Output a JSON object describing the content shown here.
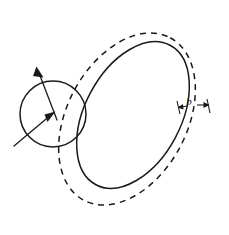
{
  "figure": {
    "title": "",
    "background_color": "#ffffff",
    "stroke_color": "#1a1a1a",
    "width": 229,
    "height": 235
  },
  "labels": {
    "gap_label": "b"
  },
  "shapes": {
    "outer_dashed_ellipse": {
      "name": "outer-dashed-ellipse",
      "style": "dashed",
      "center_x": 127,
      "center_y": 119,
      "radius_x": 92,
      "radius_y": 60,
      "rotation_deg": -62
    },
    "inner_solid_ellipse": {
      "name": "inner-solid-ellipse",
      "style": "solid",
      "center_x": 133,
      "center_y": 115,
      "radius_x": 79,
      "radius_y": 48,
      "rotation_deg": -62
    },
    "small_circle": {
      "name": "small-circle",
      "style": "solid",
      "center_x": 53,
      "center_y": 114,
      "radius": 33
    }
  },
  "arrows": {
    "upper_left_arrow": {
      "name": "up-left-arrow",
      "from_x": 56,
      "from_y": 118,
      "to_x": 37,
      "to_y": 69
    },
    "lower_left_arrow": {
      "name": "up-right-arrow",
      "from_x": 15,
      "from_y": 145,
      "to_x": 53,
      "to_y": 114
    }
  },
  "dimension": {
    "name": "gap-dimension-b",
    "left_tick_x": 177,
    "right_tick_x": 209,
    "line_y": 108,
    "label_x": 190,
    "label_y": 105
  }
}
